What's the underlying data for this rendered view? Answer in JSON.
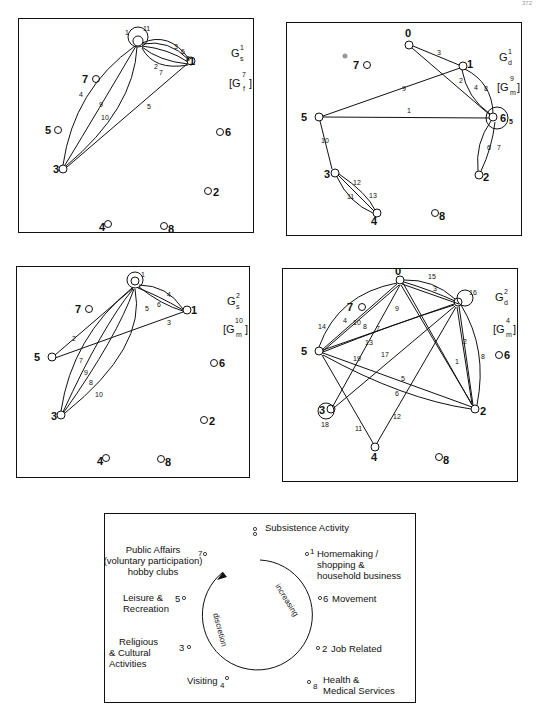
{
  "page": {
    "number": "372"
  },
  "panels": [
    {
      "id": "Gs1",
      "title": "G",
      "sub": "s",
      "sup": "1",
      "bracket": {
        "base": "G",
        "sub": "f",
        "sup": "7"
      },
      "nodes": [
        {
          "id": "0",
          "x": 135,
          "y": 42
        },
        {
          "id": "1",
          "x": 190,
          "y": 62
        },
        {
          "id": "2",
          "x": 207,
          "y": 172
        },
        {
          "id": "3",
          "x": 62,
          "y": 169
        },
        {
          "id": "4",
          "x": 106,
          "y": 206
        },
        {
          "id": "5",
          "x": 53,
          "y": 111
        },
        {
          "id": "6",
          "x": 218,
          "y": 113
        },
        {
          "id": "7",
          "x": 83,
          "y": 60
        },
        {
          "id": "8",
          "x": 163,
          "y": 208
        }
      ],
      "edges": [
        "1",
        "2",
        "3",
        "4",
        "5",
        "6",
        "7",
        "8",
        "9",
        "10",
        "11"
      ]
    },
    {
      "id": "Gd1",
      "title": "G",
      "sub": "d",
      "sup": "1",
      "bracket": {
        "base": "G",
        "sub": "m",
        "sup": "9"
      },
      "nodes": [
        {
          "id": "0",
          "x": 136,
          "y": 45
        },
        {
          "id": "1",
          "x": 190,
          "y": 66
        },
        {
          "id": "2",
          "x": 207,
          "y": 174
        },
        {
          "id": "3",
          "x": 61,
          "y": 172
        },
        {
          "id": "4",
          "x": 104,
          "y": 210
        },
        {
          "id": "5",
          "x": 52,
          "y": 114
        },
        {
          "id": "6",
          "x": 218,
          "y": 117
        },
        {
          "id": "7",
          "x": 80,
          "y": 63
        },
        {
          "id": "8",
          "x": 162,
          "y": 211
        }
      ],
      "edges": [
        "1",
        "2",
        "3",
        "4",
        "5",
        "6",
        "7",
        "8",
        "9",
        "10",
        "11",
        "12",
        "13"
      ]
    },
    {
      "id": "Gs2",
      "title": "G",
      "sub": "s",
      "sup": "2",
      "bracket": {
        "base": "G",
        "sub": "m",
        "sup": "10"
      },
      "nodes": [
        {
          "id": "0",
          "x": 134,
          "y": 33
        },
        {
          "id": "1",
          "x": 187,
          "y": 59
        },
        {
          "id": "2",
          "x": 204,
          "y": 168
        },
        {
          "id": "3",
          "x": 59,
          "y": 166
        },
        {
          "id": "4",
          "x": 102,
          "y": 203
        },
        {
          "id": "5",
          "x": 50,
          "y": 107
        },
        {
          "id": "6",
          "x": 215,
          "y": 110
        },
        {
          "id": "7",
          "x": 78,
          "y": 57
        },
        {
          "id": "8",
          "x": 160,
          "y": 205
        }
      ],
      "edges": [
        "1",
        "2",
        "3",
        "4",
        "5",
        "6",
        "7",
        "8",
        "9",
        "10"
      ]
    },
    {
      "id": "Gd2",
      "title": "G",
      "sub": "d",
      "sup": "2",
      "bracket": {
        "base": "G",
        "sub": "m",
        "sup": "4"
      },
      "nodes": [
        {
          "id": "0",
          "x": 133,
          "y": 43
        },
        {
          "id": "1",
          "x": 186,
          "y": 64
        },
        {
          "id": "2",
          "x": 203,
          "y": 172
        },
        {
          "id": "3",
          "x": 58,
          "y": 169
        },
        {
          "id": "4",
          "x": 102,
          "y": 207
        },
        {
          "id": "5",
          "x": 49,
          "y": 111
        },
        {
          "id": "6",
          "x": 214,
          "y": 115
        },
        {
          "id": "7",
          "x": 77,
          "y": 60
        },
        {
          "id": "8",
          "x": 158,
          "y": 210
        }
      ],
      "edges": [
        "1",
        "2",
        "3",
        "4",
        "5",
        "6",
        "7",
        "8",
        "9",
        "10",
        "11",
        "12",
        "13",
        "14",
        "15",
        "16",
        "17",
        "18",
        "19"
      ]
    }
  ],
  "legend": {
    "items": [
      {
        "num": "0",
        "label": "Subsistence Activity"
      },
      {
        "num": "1",
        "label": "Homemaking / shopping & household business"
      },
      {
        "num": "6",
        "label": "Movement"
      },
      {
        "num": "2",
        "label": "Job Related"
      },
      {
        "num": "8",
        "label": "Health & Medical Services"
      },
      {
        "num": "4",
        "label": "Visiting"
      },
      {
        "num": "3",
        "label": "Religious & Cultural Activities"
      },
      {
        "num": "5",
        "label": "Leisure & Recreation"
      },
      {
        "num": "7",
        "label": "Public Affairs (voluntary participation) hobby clubs"
      }
    ],
    "arrow_text_right": "increasing",
    "arrow_text_left": "discretion",
    "lines": {
      "subsistence": "Subsistence Activity",
      "home1": "Homemaking /",
      "home2": "shopping &",
      "home3": "household business",
      "movement": "Movement",
      "job": "Job Related",
      "health1": "Health &",
      "health2": "Medical Services",
      "visiting": "Visiting",
      "rel1": "Religious",
      "rel2": "& Cultural",
      "rel3": "Activities",
      "leis1": "Leisure &",
      "leis2": "Recreation",
      "pub1": "Public Affairs",
      "pub2": "(voluntary participation)",
      "pub3": "hobby clubs"
    }
  }
}
